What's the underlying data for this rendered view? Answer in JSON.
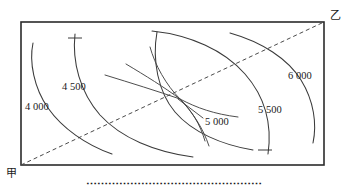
{
  "page": {
    "top_text": "⋯⋯⋯⋯⋯⋯⋯⋯⋯⋯⋯⋯⋯⋯⋯⋯⋯⋯⋯⋯⋯⋯⋯",
    "caption": "⋯⋯⋯⋯⋯⋯⋯⋯⋯⋯⋯⋯⋯⋯⋯⋯"
  },
  "axes": {
    "origin_label": "甲",
    "corner_label": "乙"
  },
  "chart_data": {
    "type": "line",
    "title": "",
    "xlabel": "甲",
    "ylabel": "乙",
    "grid": false,
    "legend": "none",
    "box": {
      "x0": 21,
      "y0": 22,
      "x1": 324,
      "y1": 165
    },
    "contract_line": {
      "style": "dashed",
      "from": [
        21,
        165
      ],
      "to": [
        324,
        22
      ]
    },
    "convergence_point": [
      176,
      96
    ],
    "contours": [
      {
        "label": "4 000",
        "value": 4000,
        "label_pos": [
          25,
          101
        ],
        "origin": "甲",
        "path": "M 33,43 C 29,62 34,88 48,108 C 62,128 86,145 112,154"
      },
      {
        "label": "4 500",
        "value": 4500,
        "label_pos": [
          62,
          81
        ],
        "origin": "甲",
        "tick": [
          75,
          38
        ],
        "path": "M 75,34 C 72,62 80,92 100,115 C 121,138 155,152 193,157"
      },
      {
        "label": "5 000",
        "value": 5000,
        "label_pos": [
          205,
          116
        ],
        "origin": "center",
        "leader_from": [
          203,
          118
        ],
        "leader_to": [
          178,
          99
        ],
        "path": "M 157,32 C 152,60 158,92 175,112 C 192,132 222,145 253,150"
      },
      {
        "label": "5 500",
        "value": 5500,
        "label_pos": [
          258,
          104
        ],
        "origin": "乙",
        "tick": [
          265,
          150
        ],
        "path": "M 152,31 C 190,35 224,50 245,74 C 266,98 272,126 268,154"
      },
      {
        "label": "6 000",
        "value": 6000,
        "label_pos": [
          288,
          70
        ],
        "origin": "乙",
        "path": "M 230,33 C 262,42 288,59 301,80 C 314,101 317,124 313,143"
      }
    ],
    "fan_curves": [
      "M 126,64 C 146,76 164,87 180,99",
      "M 105,75 C 131,83 157,91 180,99",
      "M 150,47 C 155,65 166,85 180,99",
      "M 180,99 C 192,111 200,124 205,141",
      "M 180,99 C 197,108 214,114 238,117",
      "M 180,99 C 193,113 203,128 209,146"
    ]
  }
}
